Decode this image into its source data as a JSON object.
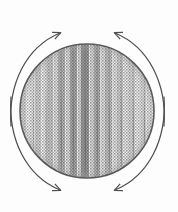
{
  "figure": {
    "background_color": "#fdfdfd",
    "ink_color": "#4a4a4a",
    "outline_color": "#555555",
    "alt_text": "A halftone-shaded circle with vertical streak texture, encircled by four curved arrows indicating rotation"
  },
  "circle": {
    "name": "shaded-disc",
    "center_x": 87,
    "center_y": 111,
    "radius": 67,
    "outline_color": "#5a5a5a",
    "outline_width": 1.6,
    "fill_description": "halftone dithered vertical streak shading",
    "fill_base_color": "#d8d8d8",
    "streaks": [
      {
        "x": 24,
        "width": 4,
        "darkness": 0.18
      },
      {
        "x": 30,
        "width": 3,
        "darkness": 0.1
      },
      {
        "x": 36,
        "width": 5,
        "darkness": 0.26
      },
      {
        "x": 43,
        "width": 3,
        "darkness": 0.14
      },
      {
        "x": 48,
        "width": 4,
        "darkness": 0.34
      },
      {
        "x": 54,
        "width": 3,
        "darkness": 0.2
      },
      {
        "x": 59,
        "width": 5,
        "darkness": 0.42
      },
      {
        "x": 66,
        "width": 3,
        "darkness": 0.24
      },
      {
        "x": 71,
        "width": 4,
        "darkness": 0.5
      },
      {
        "x": 77,
        "width": 3,
        "darkness": 0.3
      },
      {
        "x": 82,
        "width": 5,
        "darkness": 0.56
      },
      {
        "x": 89,
        "width": 3,
        "darkness": 0.28
      },
      {
        "x": 94,
        "width": 4,
        "darkness": 0.46
      },
      {
        "x": 100,
        "width": 3,
        "darkness": 0.22
      },
      {
        "x": 105,
        "width": 5,
        "darkness": 0.38
      },
      {
        "x": 112,
        "width": 3,
        "darkness": 0.18
      },
      {
        "x": 117,
        "width": 4,
        "darkness": 0.3
      },
      {
        "x": 123,
        "width": 3,
        "darkness": 0.14
      },
      {
        "x": 128,
        "width": 5,
        "darkness": 0.24
      },
      {
        "x": 135,
        "width": 3,
        "darkness": 0.12
      },
      {
        "x": 140,
        "width": 4,
        "darkness": 0.2
      },
      {
        "x": 146,
        "width": 3,
        "darkness": 0.1
      }
    ]
  },
  "arrows": [
    {
      "name": "arrow-top-left",
      "label": "upper-left curved arrow",
      "direction": "clockwise-to-top",
      "path": "M 11 126 C 8 84 26 47 60 33",
      "head_x": 62,
      "head_y": 32,
      "head_angle": -22,
      "color": "#4f4f4f"
    },
    {
      "name": "arrow-top-right",
      "label": "upper-right curved arrow",
      "direction": "counterclockwise-to-top",
      "path": "M 164 126 C 167 84 149 47 115 33",
      "head_x": 113,
      "head_y": 32,
      "head_angle": 202,
      "color": "#4f4f4f"
    },
    {
      "name": "arrow-bottom-left",
      "label": "lower-left curved arrow",
      "direction": "counterclockwise-to-bottom",
      "path": "M 11 97 C 8 139 26 176 60 190",
      "head_x": 62,
      "head_y": 191,
      "head_angle": 22,
      "color": "#4f4f4f"
    },
    {
      "name": "arrow-bottom-right",
      "label": "lower-right curved arrow",
      "direction": "clockwise-to-bottom",
      "path": "M 164 97 C 167 139 149 176 115 190",
      "head_x": 113,
      "head_y": 191,
      "head_angle": 158,
      "color": "#4f4f4f"
    }
  ],
  "annotations": {
    "arc_gap_left_y_range": [
      97,
      126
    ],
    "arc_gap_right_y_range": [
      97,
      126
    ],
    "arc_gap_top_x_range": [
      62,
      113
    ],
    "arc_gap_bottom_x_range": [
      62,
      113
    ]
  }
}
